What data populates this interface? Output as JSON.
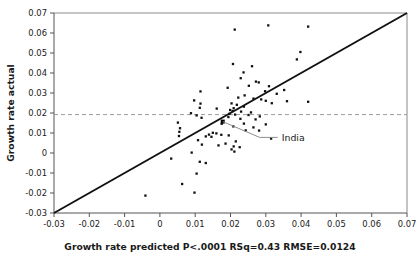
{
  "chart_data": {
    "type": "scatter",
    "title": "",
    "xlabel": "Growth rate predicted P<.0001 RSq=0.43 RMSE=0.0124",
    "ylabel": "Growth rate actual",
    "xlim": [
      -0.03,
      0.07
    ],
    "ylim": [
      -0.03,
      0.07
    ],
    "xticks": [
      -0.03,
      -0.02,
      -0.01,
      0,
      0.01,
      0.02,
      0.03,
      0.04,
      0.05,
      0.06,
      0.07
    ],
    "xticklabels": [
      "-0.03",
      "-0.02",
      "-0.01",
      "0",
      "0.01",
      "0.02",
      "0.03",
      "0.04",
      "0.05",
      "0.06",
      "0.07"
    ],
    "yticks": [
      -0.03,
      -0.02,
      -0.01,
      0,
      0.01,
      0.02,
      0.03,
      0.04,
      0.05,
      0.06,
      0.07
    ],
    "yticklabels": [
      "-0.03",
      "-0.02",
      "-0.01",
      "0",
      "0.01",
      "0.02",
      "0.03",
      "0.04",
      "0.05",
      "0.06",
      "0.07"
    ],
    "grid": false,
    "legend": "none",
    "fit_statistics": {
      "p_value_text": "P<.0001",
      "rsq_text": "RSq=0.43",
      "rmse_text": "RMSE=0.0124",
      "rsq": 0.43,
      "rmse": 0.0124
    },
    "identity_line": {
      "label": "identity line y=x",
      "from": [
        -0.03,
        -0.03
      ],
      "to": [
        0.07,
        0.07
      ],
      "color": "#111111"
    },
    "reference_line": {
      "label": "mean actual growth rate",
      "orientation": "horizontal",
      "y": 0.0192,
      "style": "dashed",
      "color": "#9a9a9a"
    },
    "annotations": [
      {
        "text": "India",
        "point": [
          0.0178,
          0.0157
        ],
        "label_at": [
          0.0345,
          0.0073
        ]
      }
    ],
    "series": [
      {
        "name": "countries",
        "marker": "square",
        "color": "#111111",
        "points": [
          [
            0.0212,
            0.0617
          ],
          [
            0.0307,
            0.0638
          ],
          [
            0.042,
            0.0632
          ],
          [
            0.0398,
            0.0505
          ],
          [
            0.0388,
            0.0468
          ],
          [
            0.0207,
            0.0445
          ],
          [
            0.0261,
            0.0434
          ],
          [
            0.0237,
            0.0403
          ],
          [
            0.0229,
            0.0374
          ],
          [
            0.0272,
            0.0357
          ],
          [
            0.028,
            0.0353
          ],
          [
            0.0252,
            0.0336
          ],
          [
            0.0309,
            0.0334
          ],
          [
            0.0192,
            0.0326
          ],
          [
            0.0115,
            0.0308
          ],
          [
            0.0298,
            0.0309
          ],
          [
            0.0352,
            0.0315
          ],
          [
            0.0331,
            0.0296
          ],
          [
            0.024,
            0.0288
          ],
          [
            0.0222,
            0.0277
          ],
          [
            0.0265,
            0.0272
          ],
          [
            0.0287,
            0.0268
          ],
          [
            0.0097,
            0.0263
          ],
          [
            0.03,
            0.0261
          ],
          [
            0.036,
            0.0259
          ],
          [
            0.042,
            0.0256
          ],
          [
            0.0317,
            0.0249
          ],
          [
            0.0203,
            0.0248
          ],
          [
            0.0115,
            0.0247
          ],
          [
            0.0218,
            0.0241
          ],
          [
            0.0238,
            0.0232
          ],
          [
            0.0113,
            0.0226
          ],
          [
            0.0209,
            0.0224
          ],
          [
            0.0161,
            0.0222
          ],
          [
            0.0199,
            0.0215
          ],
          [
            0.0206,
            0.021
          ],
          [
            0.023,
            0.0207
          ],
          [
            0.0258,
            0.0203
          ],
          [
            0.0088,
            0.0199
          ],
          [
            0.0197,
            0.0196
          ],
          [
            0.0213,
            0.0192
          ],
          [
            0.0251,
            0.019
          ],
          [
            0.0104,
            0.0188
          ],
          [
            0.0283,
            0.0183
          ],
          [
            0.0194,
            0.018
          ],
          [
            0.0118,
            0.0176
          ],
          [
            0.0228,
            0.0171
          ],
          [
            0.0271,
            0.0168
          ],
          [
            0.0178,
            0.0157
          ],
          [
            0.0051,
            0.0152
          ],
          [
            0.0238,
            0.0147
          ],
          [
            0.0175,
            0.0146
          ],
          [
            0.03,
            0.0143
          ],
          [
            0.0208,
            0.0133
          ],
          [
            0.0265,
            0.0128
          ],
          [
            0.0057,
            0.0124
          ],
          [
            0.0243,
            0.0113
          ],
          [
            0.0281,
            0.0112
          ],
          [
            0.0055,
            0.0106
          ],
          [
            0.015,
            0.0101
          ],
          [
            0.016,
            0.0098
          ],
          [
            0.0139,
            0.0092
          ],
          [
            0.0174,
            0.0091
          ],
          [
            0.0195,
            0.0088
          ],
          [
            0.0054,
            0.0085
          ],
          [
            0.013,
            0.0083
          ],
          [
            0.0146,
            0.0081
          ],
          [
            0.0315,
            0.0072
          ],
          [
            0.0108,
            0.0064
          ],
          [
            0.0215,
            0.0058
          ],
          [
            0.0186,
            0.0047
          ],
          [
            0.0119,
            0.0042
          ],
          [
            0.0166,
            0.0038
          ],
          [
            0.0209,
            0.0033
          ],
          [
            0.0226,
            0.0029
          ],
          [
            0.0203,
            0.0018
          ],
          [
            0.0211,
            0.0007
          ],
          [
            0.009,
            0.0002
          ],
          [
            0.0032,
            -0.0028
          ],
          [
            0.0113,
            -0.0044
          ],
          [
            0.013,
            -0.005
          ],
          [
            0.0104,
            -0.0103
          ],
          [
            0.0063,
            -0.0155
          ],
          [
            0.0098,
            -0.0198
          ],
          [
            -0.0041,
            -0.0213
          ]
        ]
      }
    ]
  }
}
